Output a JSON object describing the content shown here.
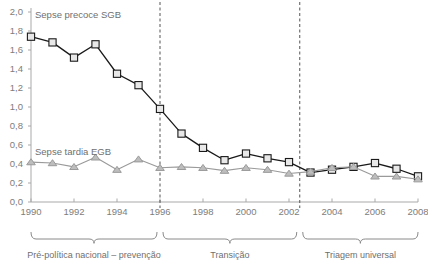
{
  "chart_data": {
    "type": "line",
    "title": "",
    "xlabel": "",
    "ylabel": "",
    "x": [
      1990,
      1991,
      1992,
      1993,
      1994,
      1995,
      1996,
      1997,
      1998,
      1999,
      2000,
      2001,
      2002,
      2003,
      2004,
      2005,
      2006,
      2007,
      2008
    ],
    "xlim": [
      1990,
      2008
    ],
    "ylim": [
      0,
      2.0
    ],
    "y_ticks": [
      "0,0",
      "0,2",
      "0,4",
      "0,6",
      "0,8",
      "1,0",
      "1,2",
      "1,4",
      "1,6",
      "1,8",
      "2,0"
    ],
    "y_tick_values": [
      0,
      0.2,
      0.4,
      0.6,
      0.8,
      1.0,
      1.2,
      1.4,
      1.6,
      1.8,
      2.0
    ],
    "x_ticks": [
      "1990",
      "1992",
      "1994",
      "1996",
      "1998",
      "2000",
      "2002",
      "2004",
      "2006",
      "2008"
    ],
    "x_tick_values": [
      1990,
      1992,
      1994,
      1996,
      1998,
      2000,
      2002,
      2004,
      2006,
      2008
    ],
    "grid": false,
    "legend_position": "inline-annotation",
    "series": [
      {
        "name": "Sepse precoce SGB",
        "marker": "square",
        "color": "#1a1a1a",
        "marker_fill": "#e8e8e8",
        "values": [
          1.74,
          1.68,
          1.52,
          1.66,
          1.35,
          1.23,
          0.98,
          0.72,
          0.57,
          0.44,
          0.51,
          0.46,
          0.42,
          0.31,
          0.34,
          0.37,
          0.41,
          0.35,
          0.27
        ]
      },
      {
        "name": "Sepse tardia EGB",
        "marker": "triangle",
        "color": "#9a9a9a",
        "marker_fill": "#bdbdbd",
        "values": [
          0.42,
          0.41,
          0.37,
          0.47,
          0.34,
          0.45,
          0.36,
          0.37,
          0.36,
          0.33,
          0.36,
          0.34,
          0.3,
          0.32,
          0.36,
          0.37,
          0.27,
          0.27,
          0.24
        ]
      }
    ],
    "annotations": [
      {
        "name": "divider-1996",
        "type": "vertical-dashed-line",
        "x": 1996
      },
      {
        "name": "divider-2002",
        "type": "vertical-dashed-line",
        "x": 2002.5
      }
    ],
    "period_brackets": [
      {
        "label": "Pré-política nacional – prevenção",
        "from": 1990,
        "to": 1996
      },
      {
        "label": "Transição",
        "from": 1996,
        "to": 2002.5
      },
      {
        "label": "Triagem universal",
        "from": 2002.5,
        "to": 2008
      }
    ]
  },
  "series_labels": {
    "early": "Sepse precoce SGB",
    "late": "Sepse tardia EGB"
  },
  "colors": {
    "early_line": "#1a1a1a",
    "late_line": "#9a9a9a",
    "axis": "#a9a9a9",
    "text": "#6f6f6f",
    "divider": "#555555"
  }
}
